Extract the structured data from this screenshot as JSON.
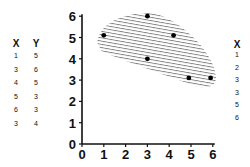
{
  "left_table": {
    "headers": [
      "X",
      "Y"
    ],
    "rows": [
      [
        "1",
        "5"
      ],
      [
        "3",
        "6"
      ],
      [
        "4",
        "5"
      ],
      [
        "5",
        "3"
      ],
      [
        "6",
        "3"
      ],
      [
        "3",
        "4"
      ]
    ]
  },
  "right_table": {
    "header": "X",
    "values": [
      "1",
      "2",
      "3",
      "3",
      "5",
      "6"
    ]
  },
  "chart_data": {
    "type": "scatter",
    "title": "",
    "xlabel": "",
    "ylabel": "",
    "xlim": [
      0,
      6
    ],
    "ylim": [
      0,
      6
    ],
    "x_ticks": [
      "0",
      "1",
      "2",
      "3",
      "4",
      "5",
      "6"
    ],
    "y_ticks": [
      "0",
      "1",
      "2",
      "3",
      "4",
      "5",
      "6"
    ],
    "grid": false,
    "legend": null,
    "points": [
      {
        "x": 1,
        "y": 5.1
      },
      {
        "x": 3,
        "y": 6
      },
      {
        "x": 4.2,
        "y": 5.1
      },
      {
        "x": 3,
        "y": 4
      },
      {
        "x": 4.9,
        "y": 3.1
      },
      {
        "x": 5.9,
        "y": 3.1
      }
    ],
    "annotations": [
      "Hatched region enclosing all points"
    ]
  }
}
